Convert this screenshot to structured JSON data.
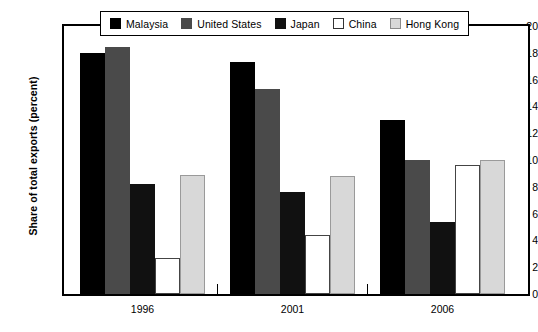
{
  "chart_data": {
    "type": "bar",
    "title": "",
    "subtitle": "",
    "xlabel": "",
    "ylabel": "Share of total exports (percent)",
    "categories": [
      "1996",
      "2001",
      "2006"
    ],
    "series": [
      {
        "name": "Malaysia",
        "color": "#000000",
        "values": [
          18.0,
          17.3,
          13.0
        ]
      },
      {
        "name": "United States",
        "color": "#4a4a4a",
        "values": [
          18.4,
          15.3,
          10.0
        ]
      },
      {
        "name": "Japan",
        "color": "#111111",
        "values": [
          8.2,
          7.6,
          5.4
        ]
      },
      {
        "name": "China",
        "color": "#ffffff",
        "values": [
          2.7,
          4.4,
          9.6
        ]
      },
      {
        "name": "Hong Kong",
        "color": "#d8d8d8",
        "values": [
          8.9,
          8.8,
          10.0
        ]
      }
    ],
    "ylim": [
      0,
      20
    ],
    "yticks": [
      0,
      2,
      4,
      6,
      8,
      10,
      12,
      14,
      16,
      18,
      20
    ],
    "ytick_labels": [
      "0",
      "2",
      "4",
      "6",
      "8",
      "10",
      "12",
      "14",
      "16",
      "18",
      "20"
    ],
    "grid": false,
    "legend_position": "top"
  },
  "legend": {
    "items": [
      {
        "label": "Malaysia",
        "swatch": "legend-swatch-malaysia"
      },
      {
        "label": "United States",
        "swatch": "legend-swatch-united-states"
      },
      {
        "label": "Japan",
        "swatch": "legend-swatch-japan"
      },
      {
        "label": "China",
        "swatch": "legend-swatch-china"
      },
      {
        "label": "Hong Kong",
        "swatch": "legend-swatch-hong-kong"
      }
    ]
  },
  "axis": {
    "y_title": "Share of total exports (percent)"
  }
}
